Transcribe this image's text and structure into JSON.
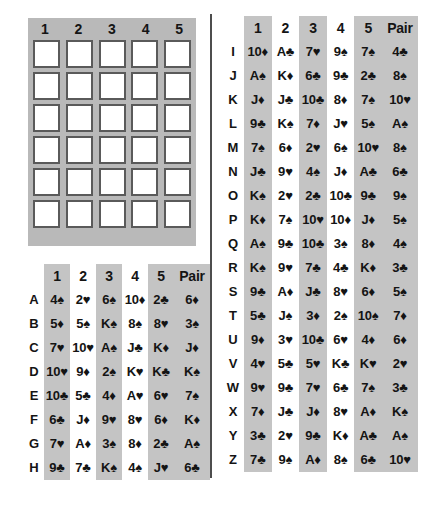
{
  "grid": {
    "headers": [
      "1",
      "2",
      "3",
      "4",
      "5"
    ],
    "rows": 6,
    "cols": 5,
    "background_color": "#b9b9b9",
    "cell_color": "#ffffff",
    "cell_border_color": "#5a5a5a"
  },
  "shared": {
    "column_headers": [
      "1",
      "2",
      "3",
      "4",
      "5",
      "Pair"
    ],
    "shaded_columns": [
      "1",
      "3",
      "5",
      "Pair"
    ],
    "shade_color": "#c4c4c4"
  },
  "table_left": {
    "row_labels": [
      "A",
      "B",
      "C",
      "D",
      "E",
      "F",
      "G",
      "H"
    ],
    "rows": [
      {
        "label": "A",
        "cells": [
          "4♠",
          "2♥",
          "6♠",
          "10♦",
          "2♣",
          "6♦"
        ]
      },
      {
        "label": "B",
        "cells": [
          "5♦",
          "5♠",
          "K♠",
          "8♠",
          "8♥",
          "3♠"
        ]
      },
      {
        "label": "C",
        "cells": [
          "7♥",
          "10♥",
          "A♠",
          "J♣",
          "K♦",
          "J♦"
        ]
      },
      {
        "label": "D",
        "cells": [
          "10♥",
          "9♦",
          "2♠",
          "K♥",
          "K♣",
          "K♠"
        ]
      },
      {
        "label": "E",
        "cells": [
          "10♣",
          "5♣",
          "4♦",
          "A♥",
          "6♥",
          "7♠"
        ]
      },
      {
        "label": "F",
        "cells": [
          "6♣",
          "J♦",
          "9♥",
          "8♥",
          "6♦",
          "K♦"
        ]
      },
      {
        "label": "G",
        "cells": [
          "7♥",
          "A♦",
          "3♠",
          "8♦",
          "2♣",
          "A♠"
        ]
      },
      {
        "label": "H",
        "cells": [
          "9♣",
          "7♣",
          "K♠",
          "4♠",
          "J♥",
          "6♣"
        ]
      }
    ]
  },
  "table_right": {
    "row_labels": [
      "I",
      "J",
      "K",
      "L",
      "M",
      "N",
      "O",
      "P",
      "Q",
      "R",
      "S",
      "T",
      "U",
      "V",
      "W",
      "X",
      "Y",
      "Z"
    ],
    "rows": [
      {
        "label": "I",
        "cells": [
          "10♦",
          "A♣",
          "7♥",
          "9♠",
          "7♠",
          "4♣"
        ]
      },
      {
        "label": "J",
        "cells": [
          "A♠",
          "K♦",
          "6♣",
          "9♣",
          "2♣",
          "8♠"
        ]
      },
      {
        "label": "K",
        "cells": [
          "J♦",
          "J♣",
          "10♣",
          "8♦",
          "7♠",
          "10♥"
        ]
      },
      {
        "label": "L",
        "cells": [
          "9♣",
          "K♠",
          "7♦",
          "J♥",
          "5♠",
          "A♠"
        ]
      },
      {
        "label": "M",
        "cells": [
          "7♠",
          "6♦",
          "2♥",
          "6♠",
          "10♥",
          "8♠"
        ]
      },
      {
        "label": "N",
        "cells": [
          "J♣",
          "9♥",
          "4♠",
          "J♦",
          "A♣",
          "6♣"
        ]
      },
      {
        "label": "O",
        "cells": [
          "K♠",
          "2♥",
          "2♣",
          "10♣",
          "9♣",
          "9♠"
        ]
      },
      {
        "label": "P",
        "cells": [
          "K♦",
          "7♠",
          "10♥",
          "10♦",
          "J♦",
          "5♠"
        ]
      },
      {
        "label": "Q",
        "cells": [
          "A♠",
          "9♣",
          "10♣",
          "3♠",
          "8♦",
          "4♠"
        ]
      },
      {
        "label": "R",
        "cells": [
          "K♠",
          "9♥",
          "7♣",
          "4♣",
          "K♦",
          "3♣"
        ]
      },
      {
        "label": "S",
        "cells": [
          "9♣",
          "A♦",
          "J♣",
          "8♥",
          "6♦",
          "5♠"
        ]
      },
      {
        "label": "T",
        "cells": [
          "5♣",
          "J♠",
          "3♦",
          "2♠",
          "10♠",
          "7♦"
        ]
      },
      {
        "label": "U",
        "cells": [
          "9♦",
          "3♥",
          "10♣",
          "6♥",
          "4♦",
          "6♦"
        ]
      },
      {
        "label": "V",
        "cells": [
          "4♥",
          "5♣",
          "5♥",
          "K♣",
          "K♥",
          "2♥"
        ]
      },
      {
        "label": "W",
        "cells": [
          "9♥",
          "9♣",
          "7♥",
          "6♣",
          "7♠",
          "3♣"
        ]
      },
      {
        "label": "X",
        "cells": [
          "7♦",
          "J♣",
          "J♦",
          "8♥",
          "A♦",
          "K♠"
        ]
      },
      {
        "label": "Y",
        "cells": [
          "3♣",
          "2♥",
          "9♣",
          "K♦",
          "A♣",
          "A♠"
        ]
      },
      {
        "label": "Z",
        "cells": [
          "7♣",
          "9♠",
          "A♦",
          "8♠",
          "6♣",
          "10♥"
        ]
      }
    ]
  }
}
